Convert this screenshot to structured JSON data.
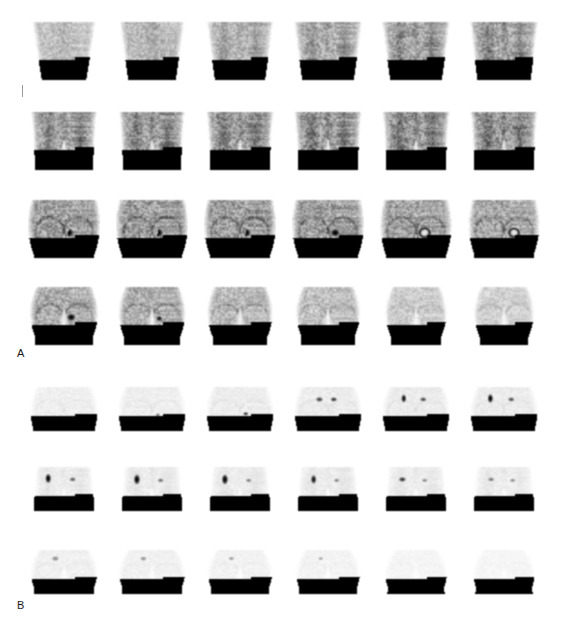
{
  "figure": {
    "modality": "PET coronal slice montage",
    "background_color": "#ffffff",
    "width": 563,
    "height": 632,
    "panels": [
      {
        "id": "A",
        "label": "A",
        "label_x": 17,
        "label_y": 348,
        "description": "Attenuation-corrected coronal PET slices of pelvis and upper thighs with intense focal uptake",
        "columns": 6,
        "rows": 4,
        "tile_width": 72,
        "tile_height": 62,
        "col_pitch": 88,
        "first_col_x": 28,
        "row_y": [
          20,
          110,
          198,
          285
        ],
        "tile_style": {
          "intensity": 0.82,
          "noise": 0.4,
          "body_shape": "pelvis-trapezoid"
        },
        "slices": [
          {
            "row": 0,
            "col": 0,
            "shape": "torso-wide",
            "body_top_w": 0.88,
            "body_bot_w": 0.62,
            "density": 0.3,
            "hot_spots": []
          },
          {
            "row": 0,
            "col": 1,
            "shape": "torso-wide",
            "body_top_w": 0.9,
            "body_bot_w": 0.66,
            "density": 0.33,
            "hot_spots": []
          },
          {
            "row": 0,
            "col": 2,
            "shape": "torso-split",
            "body_top_w": 0.92,
            "body_bot_w": 0.7,
            "density": 0.36,
            "hot_spots": []
          },
          {
            "row": 0,
            "col": 3,
            "shape": "torso-split",
            "body_top_w": 0.94,
            "body_bot_w": 0.72,
            "density": 0.4,
            "hot_spots": []
          },
          {
            "row": 0,
            "col": 4,
            "shape": "torso-split",
            "body_top_w": 0.94,
            "body_bot_w": 0.72,
            "density": 0.43,
            "hot_spots": []
          },
          {
            "row": 0,
            "col": 5,
            "shape": "torso-split",
            "body_top_w": 0.94,
            "body_bot_w": 0.74,
            "density": 0.45,
            "hot_spots": []
          },
          {
            "row": 1,
            "col": 0,
            "shape": "pelvis-legs",
            "body_top_w": 0.92,
            "body_bot_w": 0.8,
            "density": 0.46,
            "hot_spots": []
          },
          {
            "row": 1,
            "col": 1,
            "shape": "pelvis-legs",
            "body_top_w": 0.92,
            "body_bot_w": 0.8,
            "density": 0.47,
            "hot_spots": []
          },
          {
            "row": 1,
            "col": 2,
            "shape": "pelvis-legs",
            "body_top_w": 0.94,
            "body_bot_w": 0.82,
            "density": 0.48,
            "hot_spots": []
          },
          {
            "row": 1,
            "col": 3,
            "shape": "pelvis-legs",
            "body_top_w": 0.94,
            "body_bot_w": 0.82,
            "density": 0.49,
            "hot_spots": [
              {
                "x": 0.62,
                "y": 0.72,
                "r": 0.05,
                "intensity": 0.55,
                "kind": "blob"
              }
            ]
          },
          {
            "row": 1,
            "col": 4,
            "shape": "pelvis-legs",
            "body_top_w": 0.94,
            "body_bot_w": 0.82,
            "density": 0.5,
            "hot_spots": [
              {
                "x": 0.62,
                "y": 0.7,
                "r": 0.07,
                "intensity": 0.96,
                "kind": "ring"
              }
            ]
          },
          {
            "row": 1,
            "col": 5,
            "shape": "pelvis-legs",
            "body_top_w": 0.94,
            "body_bot_w": 0.82,
            "density": 0.5,
            "hot_spots": [
              {
                "x": 0.63,
                "y": 0.7,
                "r": 0.085,
                "intensity": 1.0,
                "kind": "blob"
              }
            ]
          },
          {
            "row": 2,
            "col": 0,
            "shape": "pelvis-round",
            "body_top_w": 0.92,
            "body_bot_w": 0.84,
            "density": 0.5,
            "hot_spots": [
              {
                "x": 0.56,
                "y": 0.56,
                "r": 0.085,
                "intensity": 1.0,
                "kind": "crescent"
              }
            ]
          },
          {
            "row": 2,
            "col": 1,
            "shape": "pelvis-round",
            "body_top_w": 0.92,
            "body_bot_w": 0.84,
            "density": 0.5,
            "hot_spots": [
              {
                "x": 0.58,
                "y": 0.56,
                "r": 0.085,
                "intensity": 1.0,
                "kind": "crescent"
              }
            ]
          },
          {
            "row": 2,
            "col": 2,
            "shape": "pelvis-round",
            "body_top_w": 0.92,
            "body_bot_w": 0.84,
            "density": 0.5,
            "hot_spots": [
              {
                "x": 0.58,
                "y": 0.56,
                "r": 0.08,
                "intensity": 1.0,
                "kind": "crescent"
              }
            ]
          },
          {
            "row": 2,
            "col": 3,
            "shape": "pelvis-round",
            "body_top_w": 0.92,
            "body_bot_w": 0.84,
            "density": 0.49,
            "hot_spots": [
              {
                "x": 0.6,
                "y": 0.56,
                "r": 0.075,
                "intensity": 1.0,
                "kind": "blob"
              }
            ]
          },
          {
            "row": 2,
            "col": 4,
            "shape": "pelvis-round",
            "body_top_w": 0.9,
            "body_bot_w": 0.84,
            "density": 0.47,
            "hot_spots": [
              {
                "x": 0.62,
                "y": 0.56,
                "r": 0.09,
                "intensity": 1.0,
                "kind": "ring"
              }
            ]
          },
          {
            "row": 2,
            "col": 5,
            "shape": "pelvis-round",
            "body_top_w": 0.9,
            "body_bot_w": 0.82,
            "density": 0.45,
            "hot_spots": [
              {
                "x": 0.64,
                "y": 0.56,
                "r": 0.085,
                "intensity": 1.0,
                "kind": "ring"
              }
            ]
          },
          {
            "row": 3,
            "col": 0,
            "shape": "hips-thighs",
            "body_top_w": 0.78,
            "body_bot_w": 0.8,
            "density": 0.42,
            "hot_spots": [
              {
                "x": 0.6,
                "y": 0.52,
                "r": 0.07,
                "intensity": 0.98,
                "kind": "blob"
              }
            ]
          },
          {
            "row": 3,
            "col": 1,
            "shape": "hips-thighs",
            "body_top_w": 0.76,
            "body_bot_w": 0.78,
            "density": 0.4,
            "hot_spots": [
              {
                "x": 0.6,
                "y": 0.54,
                "r": 0.05,
                "intensity": 0.92,
                "kind": "blob"
              }
            ]
          },
          {
            "row": 3,
            "col": 2,
            "shape": "hips-thighs",
            "body_top_w": 0.74,
            "body_bot_w": 0.76,
            "density": 0.36,
            "hot_spots": []
          },
          {
            "row": 3,
            "col": 3,
            "shape": "hips-thighs",
            "body_top_w": 0.72,
            "body_bot_w": 0.74,
            "density": 0.32,
            "hot_spots": []
          },
          {
            "row": 3,
            "col": 4,
            "shape": "hips-thighs",
            "body_top_w": 0.68,
            "body_bot_w": 0.7,
            "density": 0.26,
            "hot_spots": []
          },
          {
            "row": 3,
            "col": 5,
            "shape": "hips-thighs",
            "body_top_w": 0.66,
            "body_bot_w": 0.68,
            "density": 0.24,
            "hot_spots": []
          }
        ]
      },
      {
        "id": "B",
        "label": "B",
        "label_x": 17,
        "label_y": 600,
        "description": "Lower-intensity coronal slices showing focal lesion uptake in left pelvis",
        "columns": 6,
        "rows": 3,
        "tile_width": 72,
        "tile_height": 48,
        "col_pitch": 88,
        "first_col_x": 28,
        "row_y": [
          385,
          465,
          548
        ],
        "tile_style": {
          "intensity": 0.4,
          "noise": 0.55,
          "body_shape": "pelvis-round"
        },
        "slices": [
          {
            "row": 0,
            "col": 0,
            "shape": "pelvis-round",
            "body_top_w": 0.76,
            "body_bot_w": 0.86,
            "density": 0.16,
            "hot_spots": []
          },
          {
            "row": 0,
            "col": 1,
            "shape": "pelvis-round",
            "body_top_w": 0.76,
            "body_bot_w": 0.86,
            "density": 0.17,
            "hot_spots": [
              {
                "x": 0.58,
                "y": 0.62,
                "r": 0.035,
                "intensity": 0.55,
                "kind": "blob"
              }
            ]
          },
          {
            "row": 0,
            "col": 2,
            "shape": "pelvis-round",
            "body_top_w": 0.76,
            "body_bot_w": 0.86,
            "density": 0.18,
            "hot_spots": [
              {
                "x": 0.58,
                "y": 0.6,
                "r": 0.04,
                "intensity": 0.8,
                "kind": "blob"
              }
            ]
          },
          {
            "row": 0,
            "col": 3,
            "shape": "pelvis-round",
            "body_top_w": 0.76,
            "body_bot_w": 0.86,
            "density": 0.19,
            "hot_spots": [
              {
                "x": 0.38,
                "y": 0.3,
                "r": 0.055,
                "intensity": 0.72,
                "kind": "blob"
              },
              {
                "x": 0.58,
                "y": 0.3,
                "r": 0.05,
                "intensity": 0.78,
                "kind": "blob"
              }
            ]
          },
          {
            "row": 0,
            "col": 4,
            "shape": "pelvis-round",
            "body_top_w": 0.76,
            "body_bot_w": 0.86,
            "density": 0.19,
            "hot_spots": [
              {
                "x": 0.33,
                "y": 0.28,
                "r": 0.06,
                "intensity": 0.95,
                "kind": "streak"
              },
              {
                "x": 0.6,
                "y": 0.3,
                "r": 0.05,
                "intensity": 0.7,
                "kind": "blob"
              }
            ]
          },
          {
            "row": 0,
            "col": 5,
            "shape": "pelvis-round",
            "body_top_w": 0.76,
            "body_bot_w": 0.86,
            "density": 0.19,
            "hot_spots": [
              {
                "x": 0.31,
                "y": 0.28,
                "r": 0.065,
                "intensity": 1.0,
                "kind": "streak"
              },
              {
                "x": 0.6,
                "y": 0.3,
                "r": 0.05,
                "intensity": 0.68,
                "kind": "blob"
              }
            ]
          },
          {
            "row": 1,
            "col": 0,
            "shape": "pelvis-legs",
            "body_top_w": 0.74,
            "body_bot_w": 0.84,
            "density": 0.18,
            "hot_spots": [
              {
                "x": 0.28,
                "y": 0.28,
                "r": 0.07,
                "intensity": 1.0,
                "kind": "streak"
              },
              {
                "x": 0.62,
                "y": 0.3,
                "r": 0.05,
                "intensity": 0.62,
                "kind": "blob"
              }
            ]
          },
          {
            "row": 1,
            "col": 1,
            "shape": "pelvis-legs",
            "body_top_w": 0.74,
            "body_bot_w": 0.84,
            "density": 0.18,
            "hot_spots": [
              {
                "x": 0.29,
                "y": 0.3,
                "r": 0.075,
                "intensity": 1.0,
                "kind": "streak"
              },
              {
                "x": 0.62,
                "y": 0.32,
                "r": 0.048,
                "intensity": 0.55,
                "kind": "blob"
              }
            ]
          },
          {
            "row": 1,
            "col": 2,
            "shape": "pelvis-legs",
            "body_top_w": 0.74,
            "body_bot_w": 0.84,
            "density": 0.18,
            "hot_spots": [
              {
                "x": 0.29,
                "y": 0.3,
                "r": 0.075,
                "intensity": 1.0,
                "kind": "streak"
              },
              {
                "x": 0.62,
                "y": 0.32,
                "r": 0.045,
                "intensity": 0.5,
                "kind": "blob"
              }
            ]
          },
          {
            "row": 1,
            "col": 3,
            "shape": "pelvis-legs",
            "body_top_w": 0.74,
            "body_bot_w": 0.84,
            "density": 0.18,
            "hot_spots": [
              {
                "x": 0.3,
                "y": 0.3,
                "r": 0.065,
                "intensity": 0.92,
                "kind": "streak"
              },
              {
                "x": 0.62,
                "y": 0.32,
                "r": 0.045,
                "intensity": 0.48,
                "kind": "blob"
              }
            ]
          },
          {
            "row": 1,
            "col": 4,
            "shape": "pelvis-legs",
            "body_top_w": 0.74,
            "body_bot_w": 0.84,
            "density": 0.17,
            "hot_spots": [
              {
                "x": 0.31,
                "y": 0.3,
                "r": 0.055,
                "intensity": 0.78,
                "kind": "blob"
              },
              {
                "x": 0.62,
                "y": 0.32,
                "r": 0.045,
                "intensity": 0.46,
                "kind": "blob"
              }
            ]
          },
          {
            "row": 1,
            "col": 5,
            "shape": "pelvis-legs",
            "body_top_w": 0.74,
            "body_bot_w": 0.84,
            "density": 0.17,
            "hot_spots": [
              {
                "x": 0.32,
                "y": 0.3,
                "r": 0.05,
                "intensity": 0.52,
                "kind": "blob"
              },
              {
                "x": 0.62,
                "y": 0.32,
                "r": 0.045,
                "intensity": 0.44,
                "kind": "blob"
              }
            ]
          },
          {
            "row": 2,
            "col": 0,
            "shape": "hips-thighs",
            "body_top_w": 0.7,
            "body_bot_w": 0.84,
            "density": 0.15,
            "hot_spots": [
              {
                "x": 0.38,
                "y": 0.22,
                "r": 0.055,
                "intensity": 0.45,
                "kind": "blob"
              }
            ]
          },
          {
            "row": 2,
            "col": 1,
            "shape": "hips-thighs",
            "body_top_w": 0.68,
            "body_bot_w": 0.84,
            "density": 0.14,
            "hot_spots": [
              {
                "x": 0.38,
                "y": 0.22,
                "r": 0.05,
                "intensity": 0.42,
                "kind": "blob"
              }
            ]
          },
          {
            "row": 2,
            "col": 2,
            "shape": "hips-thighs",
            "body_top_w": 0.66,
            "body_bot_w": 0.82,
            "density": 0.13,
            "hot_spots": [
              {
                "x": 0.38,
                "y": 0.22,
                "r": 0.045,
                "intensity": 0.38,
                "kind": "blob"
              }
            ]
          },
          {
            "row": 2,
            "col": 3,
            "shape": "hips-thighs",
            "body_top_w": 0.64,
            "body_bot_w": 0.82,
            "density": 0.12,
            "hot_spots": [
              {
                "x": 0.4,
                "y": 0.22,
                "r": 0.04,
                "intensity": 0.34,
                "kind": "blob"
              }
            ]
          },
          {
            "row": 2,
            "col": 4,
            "shape": "hips-thighs",
            "body_top_w": 0.6,
            "body_bot_w": 0.8,
            "density": 0.1,
            "hot_spots": []
          },
          {
            "row": 2,
            "col": 5,
            "shape": "hips-thighs",
            "body_top_w": 0.58,
            "body_bot_w": 0.8,
            "density": 0.09,
            "hot_spots": []
          }
        ]
      }
    ],
    "scale_tick": {
      "x": 22,
      "y": 85,
      "height": 12,
      "color": "#9a9a9a"
    }
  }
}
